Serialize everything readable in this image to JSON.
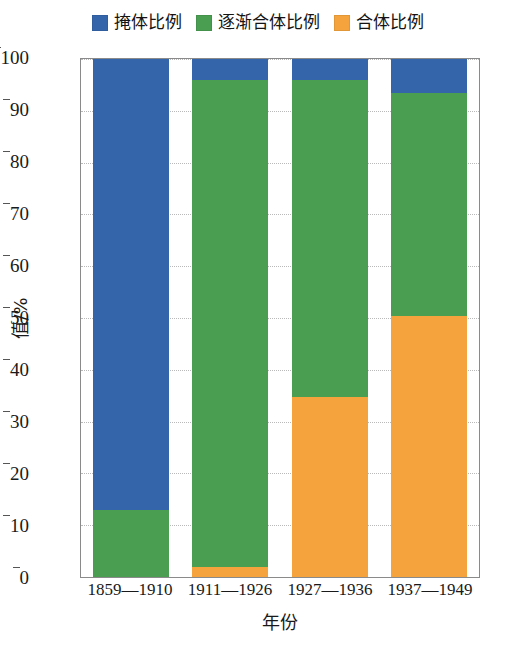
{
  "chart_data": {
    "type": "bar",
    "subtype": "stacked-bar-100",
    "title": "",
    "xlabel": "年份",
    "ylabel": "值/%",
    "categories": [
      "1859—1910",
      "1911—1926",
      "1927—1936",
      "1937—1949"
    ],
    "series": [
      {
        "name": "合体比例",
        "color": "#f5a33c",
        "values": [
          0.0,
          2.0,
          34.8,
          50.3
        ]
      },
      {
        "name": "逐渐合体比例",
        "color": "#4a9e52",
        "values": [
          13.0,
          94.0,
          61.2,
          43.2
        ]
      },
      {
        "name": "掩体比例",
        "color": "#3465ab",
        "values": [
          87.0,
          4.0,
          4.0,
          6.5
        ]
      }
    ],
    "ylim": [
      0,
      100
    ],
    "yticks": [
      0,
      10,
      20,
      30,
      40,
      50,
      60,
      70,
      80,
      90,
      100
    ],
    "ytick_labels": [
      "0",
      "10",
      "20",
      "30",
      "40",
      "50",
      "60",
      "70",
      "80",
      "90",
      "100"
    ],
    "grid": true,
    "grid_axis": "y",
    "legend_position": "top-center",
    "legend": [
      {
        "label": "掩体比例",
        "color": "#3465ab"
      },
      {
        "label": "逐渐合体比例",
        "color": "#4a9e52"
      },
      {
        "label": "合体比例",
        "color": "#f5a33c"
      }
    ]
  },
  "colors": {
    "blue": "#3465ab",
    "green": "#4a9e52",
    "orange": "#f5a33c",
    "axis": "#8a8a8a",
    "grid": "#b9b9b9",
    "text": "#1a1a1a",
    "background": "#ffffff"
  }
}
